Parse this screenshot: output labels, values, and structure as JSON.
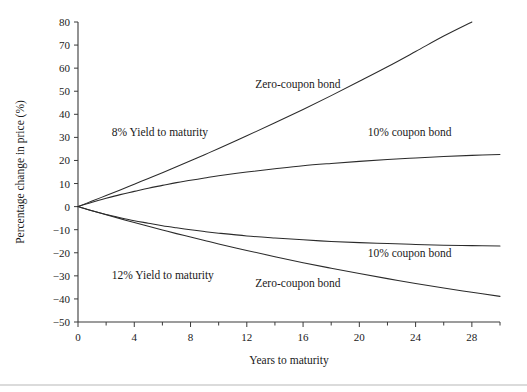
{
  "chart_data": {
    "type": "line",
    "title": "",
    "xlabel": "Years to maturity",
    "ylabel": "Percentage change in price (%)",
    "xlim": [
      0,
      30
    ],
    "ylim": [
      -50,
      80
    ],
    "xticks": [
      0,
      4,
      8,
      12,
      16,
      20,
      24,
      28
    ],
    "xtick_labels": [
      "0",
      "4",
      "8",
      "12",
      "16",
      "20",
      "24",
      "28"
    ],
    "xminor_ticks": [
      2,
      6,
      10,
      14,
      18,
      22,
      26,
      30
    ],
    "yticks": [
      -50,
      -40,
      -30,
      -20,
      -10,
      0,
      10,
      20,
      30,
      40,
      50,
      60,
      70,
      80
    ],
    "ytick_labels": [
      "−50",
      "−40",
      "−30",
      "−20",
      "−10",
      "0",
      "10",
      "20",
      "30",
      "40",
      "50",
      "60",
      "70",
      "80"
    ],
    "grid": false,
    "legend_position": "inline-annotations",
    "x": [
      0,
      1,
      2,
      3,
      4,
      5,
      6,
      7,
      8,
      9,
      10,
      12,
      14,
      16,
      18,
      20,
      22,
      24,
      26,
      28,
      30
    ],
    "series": [
      {
        "name": "Zero-coupon bond (8% Yield to maturity)",
        "yield": 8,
        "bond": "zero-coupon",
        "values": [
          0,
          2.4,
          4.8,
          7.2,
          9.7,
          12.2,
          14.7,
          17.3,
          19.9,
          22.5,
          25.2,
          30.7,
          36.3,
          42.1,
          48.1,
          54.3,
          60.6,
          67.2,
          73.9,
          80.8,
          87.9
        ]
      },
      {
        "name": "10% coupon bond (8% Yield to maturity)",
        "yield": 8,
        "bond": "10% coupon",
        "values": [
          0,
          1.9,
          3.6,
          5.2,
          6.6,
          8.0,
          9.2,
          10.4,
          11.4,
          12.4,
          13.4,
          15.0,
          16.4,
          17.7,
          18.7,
          19.6,
          20.4,
          21.1,
          21.7,
          22.2,
          22.6
        ]
      },
      {
        "name": "10% coupon bond (12% Yield to maturity)",
        "yield": 12,
        "bond": "10% coupon",
        "values": [
          0,
          -1.8,
          -3.4,
          -4.8,
          -6.1,
          -7.2,
          -8.3,
          -9.2,
          -10.0,
          -10.8,
          -11.5,
          -12.7,
          -13.6,
          -14.4,
          -15.1,
          -15.6,
          -16.0,
          -16.4,
          -16.7,
          -16.9,
          -17.1
        ]
      },
      {
        "name": "Zero-coupon bond (12% Yield to maturity)",
        "yield": 12,
        "bond": "zero-coupon",
        "values": [
          0,
          -1.8,
          -3.5,
          -5.2,
          -6.9,
          -8.5,
          -10.1,
          -11.7,
          -13.2,
          -14.7,
          -16.2,
          -19.0,
          -21.7,
          -24.3,
          -26.7,
          -29.0,
          -31.2,
          -33.3,
          -35.3,
          -37.1,
          -38.9
        ]
      }
    ],
    "annotations": [
      {
        "text": "Zero-coupon bond",
        "x": 12.6,
        "y": 51.5
      },
      {
        "text": "8% Yield to maturity",
        "x": 2.4,
        "y": 30.5
      },
      {
        "text": "10% coupon bond",
        "x": 20.6,
        "y": 30.5
      },
      {
        "text": "10% coupon bond",
        "x": 20.6,
        "y": -22.0
      },
      {
        "text": "12% Yield to maturity",
        "x": 2.4,
        "y": -31.5
      },
      {
        "text": "Zero-coupon bond",
        "x": 12.6,
        "y": -35.0
      }
    ],
    "colors": {
      "curve": "#2b2b2b",
      "axis": "#3a3a3a",
      "text": "#1a1a1a",
      "background": "#ffffff",
      "footer_rule": "#b8b8b8"
    }
  }
}
